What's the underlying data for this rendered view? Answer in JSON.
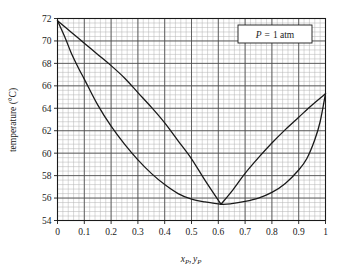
{
  "chart_data": {
    "type": "line",
    "title": "",
    "xlabel": "x_P, y_P",
    "xlabel_parts": {
      "x_var": "x",
      "x_sub": "P",
      "comma": ",",
      "y_var": "y",
      "y_sub": "P"
    },
    "ylabel": "temperature (°C)",
    "xlim": [
      0,
      1
    ],
    "ylim": [
      54,
      72
    ],
    "x_major_step": 0.1,
    "y_major_step": 2,
    "x_minor_per_major": 5,
    "y_minor_per_major": 5,
    "grid": true,
    "grid_major_color": "#4d4d4d",
    "grid_minor_color": "#b3b3b3",
    "curve_color": "#1a1a1a",
    "xticks": [
      "0",
      "0.1",
      "0.2",
      "0.3",
      "0.4",
      "0.5",
      "0.6",
      "0.7",
      "0.8",
      "0.9",
      "1"
    ],
    "xtick_values": [
      0,
      0.1,
      0.2,
      0.3,
      0.4,
      0.5,
      0.6,
      0.7,
      0.8,
      0.9,
      1.0
    ],
    "yticks": [
      "54",
      "56",
      "58",
      "60",
      "62",
      "64",
      "66",
      "68",
      "70",
      "72"
    ],
    "ytick_values": [
      54,
      56,
      58,
      60,
      62,
      64,
      66,
      68,
      70,
      72
    ],
    "legend": {
      "position": "top-right",
      "text": "P = 1 atm",
      "symbol": "P",
      "equals": "=",
      "value": "1 atm",
      "boxed": true
    },
    "annotations": [
      {
        "label": "azeotrope",
        "x": 0.61,
        "y": 55.45
      }
    ],
    "series": [
      {
        "name": "bubble-point curve",
        "role": "upper",
        "x": [
          0.0,
          0.05,
          0.1,
          0.15,
          0.2,
          0.25,
          0.3,
          0.35,
          0.4,
          0.45,
          0.5,
          0.55,
          0.61,
          0.65,
          0.7,
          0.75,
          0.8,
          0.85,
          0.9,
          0.95,
          1.0
        ],
        "values": [
          71.8,
          70.8,
          69.8,
          68.8,
          67.8,
          66.7,
          65.4,
          64.1,
          62.7,
          61.1,
          59.5,
          57.6,
          55.45,
          56.6,
          58.2,
          59.6,
          60.9,
          62.1,
          63.2,
          64.3,
          65.3
        ]
      },
      {
        "name": "dew-point curve",
        "role": "lower",
        "x": [
          0.0,
          0.03,
          0.05,
          0.08,
          0.1,
          0.15,
          0.2,
          0.25,
          0.3,
          0.35,
          0.4,
          0.45,
          0.5,
          0.55,
          0.61,
          0.65,
          0.7,
          0.75,
          0.8,
          0.85,
          0.9,
          0.93,
          0.96,
          0.98,
          1.0
        ],
        "values": [
          71.8,
          70.2,
          69.0,
          67.5,
          66.6,
          64.3,
          62.4,
          60.8,
          59.4,
          58.2,
          57.2,
          56.4,
          55.9,
          55.65,
          55.45,
          55.5,
          55.7,
          56.0,
          56.5,
          57.3,
          58.5,
          59.5,
          61.2,
          62.8,
          65.3
        ]
      }
    ]
  }
}
